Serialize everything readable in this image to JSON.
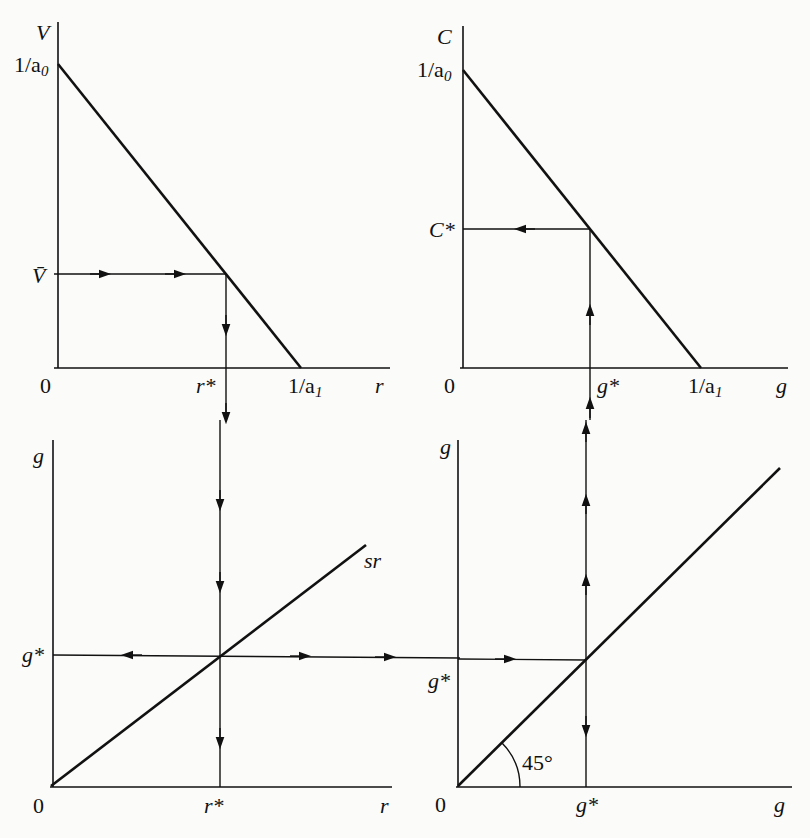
{
  "diagram": {
    "panels": {
      "top_left": {
        "y_axis_label": "V",
        "x_axis_label": "r",
        "origin_label": "0",
        "y_intercept_label": "1/a",
        "y_intercept_sub": "0",
        "x_intercept_label": "1/a",
        "x_intercept_sub": "1",
        "level_label": "V̄",
        "equilibrium_x_label": "r*"
      },
      "top_right": {
        "y_axis_label": "C",
        "x_axis_label": "g",
        "origin_label": "0",
        "y_intercept_label": "1/a",
        "y_intercept_sub": "0",
        "x_intercept_label": "1/a",
        "x_intercept_sub": "1",
        "equilibrium_y_label": "C*",
        "equilibrium_x_label": "g*"
      },
      "bottom_left": {
        "y_axis_label": "g",
        "x_axis_label": "r",
        "origin_label": "0",
        "equilibrium_y_label": "g*",
        "equilibrium_x_label": "r*",
        "line_label": "sr"
      },
      "bottom_right": {
        "y_axis_label": "g",
        "x_axis_label": "g",
        "origin_label": "0",
        "equilibrium_y_label": "g*",
        "equilibrium_x_label": "g*",
        "angle_label": "45°"
      }
    }
  }
}
